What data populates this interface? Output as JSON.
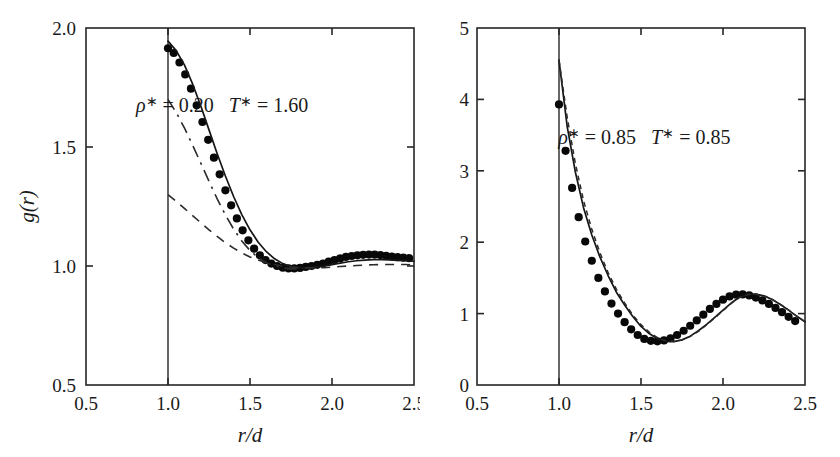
{
  "figure": {
    "panels": [
      "left",
      "right"
    ]
  },
  "chart_data": [
    {
      "panel": "left",
      "type": "scatter",
      "title": "",
      "xlabel": "r/d",
      "ylabel": "g(r)",
      "xlim": [
        0.5,
        2.5
      ],
      "ylim": [
        0.5,
        2.0
      ],
      "xticks": [
        0.5,
        1.0,
        1.5,
        2.0,
        2.5
      ],
      "xticklabels": [
        "0.5",
        "1.0",
        "1.5",
        "2.0",
        "2.5"
      ],
      "yticks": [
        0.5,
        1.0,
        1.5,
        2.0
      ],
      "yticklabels": [
        "0.5",
        "1.0",
        "1.5",
        "2.0"
      ],
      "grid": false,
      "legend": "none",
      "annotations": [
        {
          "name": "conditions",
          "text": "ρ* = 0.20   T* = 1.60",
          "rho_symbol": "ρ",
          "rho_value": "0.20",
          "t_symbol": "T",
          "t_value": "1.60",
          "x": 1.33,
          "y": 1.645
        }
      ],
      "contact_line": {
        "x": 1.0,
        "y_from": 0.5,
        "y_to": 2.0
      },
      "series": [
        {
          "name": "simulation-data-points",
          "style": "filled-circles",
          "x": [
            1.0,
            1.035,
            1.07,
            1.105,
            1.14,
            1.175,
            1.21,
            1.245,
            1.28,
            1.315,
            1.35,
            1.385,
            1.42,
            1.455,
            1.49,
            1.525,
            1.56,
            1.595,
            1.63,
            1.665,
            1.7,
            1.735,
            1.77,
            1.805,
            1.84,
            1.875,
            1.91,
            1.945,
            1.98,
            2.015,
            2.05,
            2.085,
            2.12,
            2.155,
            2.19,
            2.225,
            2.26,
            2.295,
            2.33,
            2.365,
            2.4,
            2.435,
            2.47
          ],
          "y": [
            1.915,
            1.895,
            1.855,
            1.805,
            1.745,
            1.675,
            1.605,
            1.53,
            1.455,
            1.385,
            1.318,
            1.255,
            1.2,
            1.15,
            1.108,
            1.073,
            1.045,
            1.025,
            1.01,
            1.0,
            0.993,
            0.99,
            0.99,
            0.992,
            0.996,
            1.0,
            1.005,
            1.01,
            1.018,
            1.025,
            1.032,
            1.038,
            1.042,
            1.045,
            1.047,
            1.048,
            1.048,
            1.046,
            1.043,
            1.04,
            1.037,
            1.035,
            1.033
          ]
        },
        {
          "name": "theory-solid-curve",
          "style": "solid",
          "x": [
            1.0,
            1.05,
            1.1,
            1.15,
            1.2,
            1.25,
            1.3,
            1.35,
            1.4,
            1.45,
            1.5,
            1.55,
            1.6,
            1.65,
            1.7,
            1.75,
            1.8,
            1.85,
            1.9,
            1.95,
            2.0,
            2.05,
            2.1,
            2.15,
            2.2,
            2.25,
            2.3,
            2.35,
            2.4,
            2.45,
            2.5
          ],
          "y": [
            1.945,
            1.905,
            1.845,
            1.765,
            1.672,
            1.572,
            1.472,
            1.378,
            1.292,
            1.216,
            1.152,
            1.1,
            1.06,
            1.03,
            1.01,
            0.998,
            0.992,
            0.992,
            0.996,
            1.0,
            1.006,
            1.012,
            1.018,
            1.022,
            1.025,
            1.027,
            1.027,
            1.026,
            1.024,
            1.022,
            1.02
          ]
        },
        {
          "name": "approximation-dashdot-curve",
          "style": "dash-dot",
          "x": [
            1.0,
            1.05,
            1.1,
            1.15,
            1.2,
            1.25,
            1.3,
            1.35,
            1.4,
            1.45,
            1.5,
            1.55,
            1.6,
            1.65,
            1.7,
            1.75,
            1.8
          ],
          "y": [
            1.7,
            1.645,
            1.58,
            1.508,
            1.432,
            1.356,
            1.282,
            1.215,
            1.155,
            1.105,
            1.065,
            1.035,
            1.014,
            1.0,
            0.992,
            0.988,
            0.988
          ]
        },
        {
          "name": "approximation-dashed-curve",
          "style": "dashed",
          "x": [
            1.0,
            1.05,
            1.1,
            1.15,
            1.2,
            1.25,
            1.3,
            1.35,
            1.4,
            1.45,
            1.5,
            1.55,
            1.6,
            1.65,
            1.7,
            1.75,
            1.8,
            1.85,
            1.9,
            1.95,
            2.0,
            2.05,
            2.1,
            2.15,
            2.2,
            2.25,
            2.3,
            2.35,
            2.4,
            2.45,
            2.5
          ],
          "y": [
            1.3,
            1.272,
            1.242,
            1.212,
            1.182,
            1.152,
            1.124,
            1.098,
            1.075,
            1.055,
            1.038,
            1.025,
            1.014,
            1.006,
            1.0,
            0.996,
            0.993,
            0.992,
            0.992,
            0.993,
            0.995,
            0.998,
            1.0,
            1.002,
            1.004,
            1.005,
            1.006,
            1.006,
            1.006,
            1.006,
            1.005
          ]
        }
      ]
    },
    {
      "panel": "right",
      "type": "scatter",
      "title": "",
      "xlabel": "r/d",
      "ylabel": "",
      "xlim": [
        0.5,
        2.5
      ],
      "ylim": [
        0,
        5
      ],
      "xticks": [
        0.5,
        1.0,
        1.5,
        2.0,
        2.5
      ],
      "xticklabels": [
        "0.5",
        "1.0",
        "1.5",
        "2.0",
        "2.5"
      ],
      "yticks": [
        0,
        1,
        2,
        3,
        4,
        5
      ],
      "yticklabels": [
        "0",
        "1",
        "2",
        "3",
        "4",
        "5"
      ],
      "grid": false,
      "legend": "none",
      "annotations": [
        {
          "name": "conditions",
          "text": "ρ* = 0.85   T* = 0.85",
          "rho_symbol": "ρ",
          "rho_value": "0.85",
          "t_symbol": "T",
          "t_value": "0.85",
          "x": 1.52,
          "y": 3.38
        }
      ],
      "contact_line": {
        "x": 1.0,
        "y_from": 0.0,
        "y_to": 5.0
      },
      "series": [
        {
          "name": "simulation-data-points",
          "style": "filled-circles",
          "x": [
            1.0,
            1.04,
            1.08,
            1.12,
            1.16,
            1.2,
            1.24,
            1.28,
            1.32,
            1.36,
            1.4,
            1.44,
            1.48,
            1.52,
            1.56,
            1.6,
            1.64,
            1.68,
            1.72,
            1.76,
            1.8,
            1.84,
            1.88,
            1.92,
            1.96,
            2.0,
            2.04,
            2.08,
            2.12,
            2.16,
            2.2,
            2.24,
            2.28,
            2.32,
            2.36,
            2.4,
            2.44
          ],
          "y": [
            3.93,
            3.28,
            2.76,
            2.35,
            2.01,
            1.74,
            1.5,
            1.31,
            1.14,
            1.0,
            0.88,
            0.78,
            0.7,
            0.645,
            0.618,
            0.612,
            0.625,
            0.655,
            0.7,
            0.76,
            0.83,
            0.905,
            0.985,
            1.065,
            1.135,
            1.195,
            1.24,
            1.265,
            1.268,
            1.255,
            1.225,
            1.185,
            1.135,
            1.08,
            1.02,
            0.955,
            0.895
          ]
        },
        {
          "name": "theory-solid-curve",
          "style": "solid",
          "x": [
            1.0,
            1.05,
            1.1,
            1.15,
            1.2,
            1.25,
            1.3,
            1.35,
            1.4,
            1.45,
            1.5,
            1.55,
            1.6,
            1.65,
            1.7,
            1.75,
            1.8,
            1.85,
            1.9,
            1.95,
            2.0,
            2.05,
            2.1,
            2.15,
            2.2,
            2.25,
            2.3,
            2.35,
            2.4,
            2.45,
            2.5
          ],
          "y": [
            4.55,
            3.62,
            2.98,
            2.48,
            2.1,
            1.79,
            1.53,
            1.3,
            1.12,
            0.96,
            0.82,
            0.72,
            0.648,
            0.612,
            0.608,
            0.632,
            0.684,
            0.76,
            0.85,
            0.948,
            1.048,
            1.148,
            1.228,
            1.268,
            1.272,
            1.248,
            1.198,
            1.128,
            1.048,
            0.962,
            0.886
          ]
        },
        {
          "name": "theory-dashed-curve",
          "style": "fine-dashed",
          "x": [
            1.0,
            1.05,
            1.1,
            1.15,
            1.2,
            1.25,
            1.3,
            1.35,
            1.4,
            1.45,
            1.5,
            1.55,
            1.6,
            1.65,
            1.7,
            1.75,
            1.8,
            1.85,
            1.9,
            1.95,
            2.0,
            2.05,
            2.1,
            2.15,
            2.2,
            2.25,
            2.3,
            2.35,
            2.4,
            2.45,
            2.5
          ],
          "y": [
            4.55,
            3.75,
            3.1,
            2.58,
            2.18,
            1.85,
            1.57,
            1.34,
            1.15,
            0.98,
            0.845,
            0.74,
            0.665,
            0.622,
            0.61,
            0.63,
            0.68,
            0.752,
            0.842,
            0.94,
            1.042,
            1.142,
            1.224,
            1.266,
            1.272,
            1.248,
            1.198,
            1.13,
            1.05,
            0.964,
            0.888
          ]
        }
      ]
    }
  ]
}
